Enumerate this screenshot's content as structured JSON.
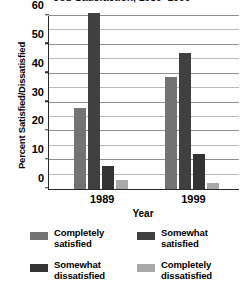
{
  "chart_data": {
    "type": "bar",
    "title": "Job Satisfaction, 1989–1999",
    "xlabel": "Year",
    "ylabel": "Percent Satisfied/Dissatisfied",
    "categories": [
      "1989",
      "1999"
    ],
    "ylim": [
      0,
      60
    ],
    "yticks": [
      0,
      10,
      20,
      30,
      40,
      50,
      60
    ],
    "ytick_labels": [
      "0",
      "10",
      "20",
      "30",
      "40",
      "50",
      "60"
    ],
    "minor_gridlines": [
      5,
      15,
      25,
      35,
      45,
      55
    ],
    "grid": true,
    "legend_position": "bottom",
    "series": [
      {
        "name": "Completely satisfied",
        "color": "#737373",
        "values": [
          28,
          39
        ]
      },
      {
        "name": "Somewhat satisfied",
        "color": "#404040",
        "values": [
          61,
          47
        ]
      },
      {
        "name": "Somewhat dissatisfied",
        "color": "#333333",
        "values": [
          8,
          12
        ]
      },
      {
        "name": "Completely dissatisfied",
        "color": "#a8a8a8",
        "values": [
          3,
          2
        ]
      }
    ]
  },
  "legend": {
    "entries": [
      {
        "label": "Completely\nsatisfied",
        "color": "#737373"
      },
      {
        "label": "Somewhat\nsatisfied",
        "color": "#404040"
      },
      {
        "label": "Somewhat\ndissatisfied",
        "color": "#333333"
      },
      {
        "label": "Completely\ndissatisfied",
        "color": "#a8a8a8"
      }
    ]
  },
  "axis": {
    "line_color": "#2b2b2b",
    "gridline_color": "#b9b9b9"
  }
}
